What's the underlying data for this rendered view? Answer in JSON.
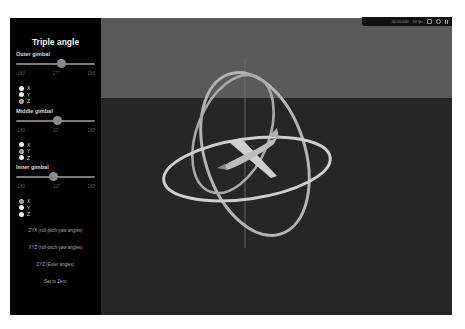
{
  "panel": {
    "title": "Triple angle",
    "gimbals": [
      {
        "label": "Outer gimbal",
        "slider": {
          "min": "-180",
          "max": "180",
          "value_label": "27°",
          "value": 27
        },
        "axes": [
          {
            "label": "X",
            "checked": false
          },
          {
            "label": "Y",
            "checked": false
          },
          {
            "label": "Z",
            "checked": true
          }
        ]
      },
      {
        "label": "Middle gimbal",
        "slider": {
          "min": "-180",
          "max": "180",
          "value_label": "10°",
          "value": 10
        },
        "axes": [
          {
            "label": "X",
            "checked": false
          },
          {
            "label": "Y",
            "checked": true
          },
          {
            "label": "Z",
            "checked": false
          }
        ]
      },
      {
        "label": "Inner gimbal",
        "slider": {
          "min": "-180",
          "max": "180",
          "value_label": "-10°",
          "value": -10
        },
        "axes": [
          {
            "label": "X",
            "checked": true
          },
          {
            "label": "Y",
            "checked": false
          },
          {
            "label": "Z",
            "checked": false
          }
        ]
      }
    ],
    "buttons": [
      "ZYX (roll-pitch-yaw angles)",
      "XYZ (roll-pitch-yaw angles)",
      "ZYZ (Euler angles)",
      "Set to Zero"
    ]
  },
  "toolbar": {
    "time": "00:00.000",
    "fps": "60 fps",
    "icons": [
      "screenshot-icon",
      "clock-icon",
      "pause-icon"
    ]
  },
  "colors": {
    "panel_bg": "#000000",
    "sky": "#5a5a5a",
    "ground": "#262626",
    "ring": "#b8b8b8",
    "airplane": "#c8c8c8"
  }
}
